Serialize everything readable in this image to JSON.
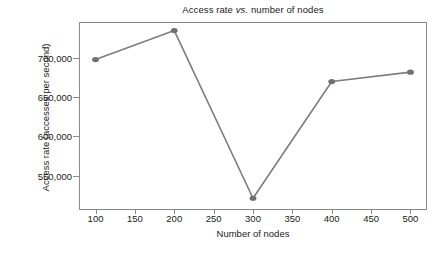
{
  "chart_data": {
    "type": "line",
    "title": "Access rate vs. number of nodes",
    "title_parts": {
      "before": "Access rate ",
      "italic": "vs.",
      "after": " number of nodes"
    },
    "xlabel": "Number of nodes",
    "ylabel": "Access rate (accesses per second)",
    "x": [
      100,
      200,
      300,
      400,
      500
    ],
    "values": [
      698000,
      735000,
      521000,
      670000,
      682000
    ],
    "series": [
      {
        "name": "Access rate",
        "values": [
          698000,
          735000,
          521000,
          670000,
          682000
        ]
      }
    ],
    "xlim": [
      79,
      521
    ],
    "ylim": [
      506000,
      746000
    ],
    "xticks": [
      100,
      150,
      200,
      250,
      300,
      350,
      400,
      450,
      500
    ],
    "xtick_labels": [
      "100",
      "150",
      "200",
      "250",
      "300",
      "350",
      "400",
      "450",
      "500"
    ],
    "yticks": [
      550000,
      600000,
      650000,
      700000
    ],
    "ytick_labels": [
      "550,000",
      "600,000",
      "650,000",
      "700,000"
    ],
    "grid": false,
    "legend": null,
    "marker": "circle",
    "line_color": "#7d7d7d",
    "marker_color": "#707070",
    "axis_color": "#8a8a8a",
    "text_color": "#1a1a1a",
    "background": "#ffffff"
  }
}
